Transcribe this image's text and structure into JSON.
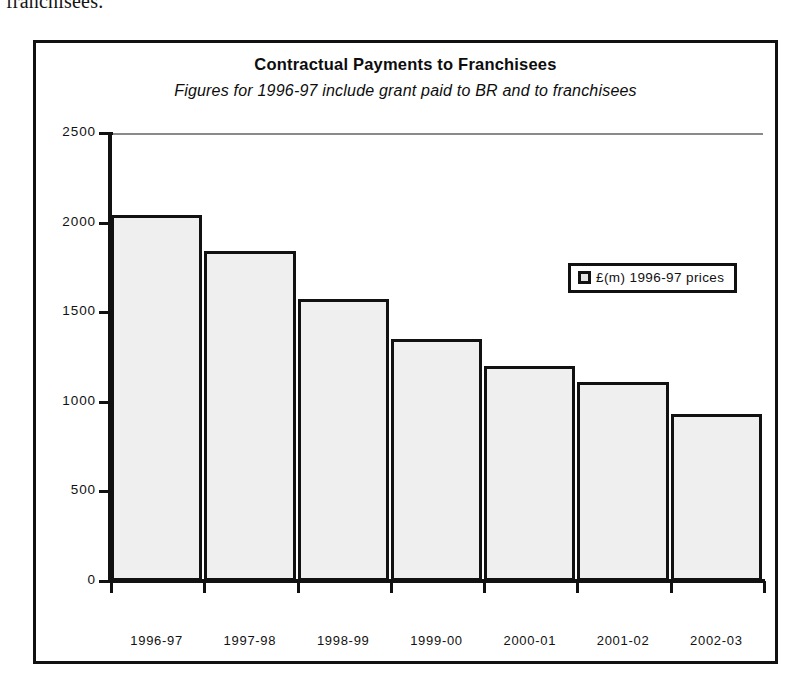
{
  "page": {
    "document_remnant_text": "franchisees."
  },
  "chart_data": {
    "type": "bar",
    "title": "Contractual Payments to Franchisees",
    "subtitle": "Figures for 1996-97 include grant paid to BR and to franchisees",
    "xlabel": "",
    "ylabel": "",
    "categories": [
      "1996-97",
      "1997-98",
      "1998-99",
      "1999-00",
      "2000-01",
      "2001-02",
      "2002-03"
    ],
    "values": [
      2042,
      1840,
      1572,
      1353,
      1202,
      1112,
      933
    ],
    "series": [
      {
        "name": "£(m) 1996-97 prices",
        "values": [
          2042,
          1840,
          1572,
          1353,
          1202,
          1112,
          933
        ]
      }
    ],
    "ylim": [
      0,
      2500
    ],
    "yticks": [
      0,
      500,
      1000,
      1500,
      2000,
      2500
    ],
    "ytick_labels": [
      "0",
      "500",
      "1000",
      "1500",
      "2000",
      "2500"
    ],
    "grid": false,
    "legend": {
      "position": "inside-top-right",
      "entries": [
        "£(m) 1996-97 prices"
      ]
    },
    "colors": {
      "bar_fill": "#efefef",
      "bar_border": "#111111",
      "axis": "#111111",
      "text": "#111111"
    }
  }
}
